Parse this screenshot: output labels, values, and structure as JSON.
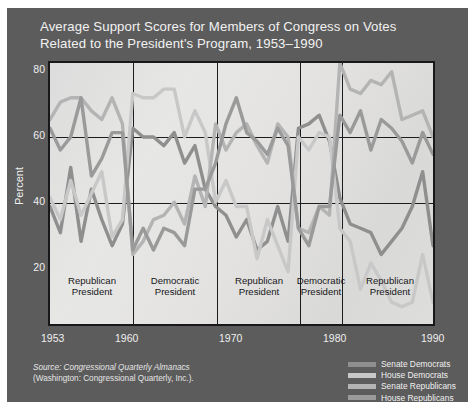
{
  "figure": {
    "background_color": "#5c5c5c",
    "plot_background_color": "#e2e2e0",
    "frame_color": "#18181a"
  },
  "title": {
    "line1": "Average Support Scores for Members of Congress on Votes",
    "line2": "Related to the President's Program, 1953–1990"
  },
  "axes": {
    "ylabel": "Percent",
    "yticks": [
      "80",
      "60",
      "40",
      "20"
    ],
    "xticks": [
      "1953",
      "1960",
      "1970",
      "1980",
      "1990"
    ]
  },
  "periods": [
    {
      "line1": "Republican",
      "line2": "President"
    },
    {
      "line1": "Democratic",
      "line2": "President"
    },
    {
      "line1": "Republican",
      "line2": "President"
    },
    {
      "line1": "Democratic",
      "line2": "President"
    },
    {
      "line1": "Republican",
      "line2": "President"
    }
  ],
  "legend": {
    "items": [
      {
        "label": "Senate Democrats",
        "color": "#8f8f8f"
      },
      {
        "label": "House Democrats",
        "color": "#c8c8c8"
      },
      {
        "label": "Senate Republicans",
        "color": "#b4b4b4"
      },
      {
        "label": "House Republicans",
        "color": "#9a9a9a"
      }
    ]
  },
  "source": {
    "line1_italic": "Source: Congressional Quarterly Almanacs",
    "line2": "(Washington: Congressional Quarterly, Inc.)."
  },
  "chart_data": {
    "type": "line",
    "title": "Average Support Scores for Members of Congress on Votes Related to the President's Program, 1953–1990",
    "xlabel": "",
    "ylabel": "Percent",
    "xlim": [
      1953,
      1990
    ],
    "ylim": [
      20,
      80
    ],
    "yticks": [
      20,
      40,
      60,
      80
    ],
    "xticks": [
      1953,
      1960,
      1970,
      1980,
      1990
    ],
    "grid": true,
    "legend_position": "bottom-right",
    "x": [
      1953,
      1954,
      1955,
      1956,
      1957,
      1958,
      1959,
      1960,
      1961,
      1962,
      1963,
      1964,
      1965,
      1966,
      1967,
      1968,
      1969,
      1970,
      1971,
      1972,
      1973,
      1974,
      1975,
      1976,
      1977,
      1978,
      1979,
      1980,
      1981,
      1982,
      1983,
      1984,
      1985,
      1986,
      1987,
      1988,
      1989,
      1990
    ],
    "series": [
      {
        "name": "Senate Democrats",
        "color": "#8f8f8f",
        "values": [
          47,
          41,
          56,
          39,
          51,
          44,
          38,
          43,
          65,
          63,
          63,
          61,
          64,
          57,
          61,
          51,
          47,
          45,
          40,
          44,
          37,
          39,
          47,
          39,
          65,
          66,
          68,
          62,
          49,
          43,
          42,
          41,
          36,
          39,
          42,
          47,
          55,
          38
        ]
      },
      {
        "name": "House Democrats",
        "color": "#c8c8c8",
        "values": [
          49,
          44,
          53,
          45,
          50,
          55,
          40,
          44,
          73,
          72,
          72,
          74,
          74,
          63,
          69,
          64,
          48,
          53,
          47,
          47,
          35,
          44,
          38,
          32,
          63,
          60,
          64,
          63,
          42,
          39,
          28,
          34,
          30,
          25,
          24,
          25,
          36,
          25
        ]
      },
      {
        "name": "Senate Republicans",
        "color": "#b4b4b4",
        "values": [
          67,
          71,
          72,
          72,
          69,
          67,
          72,
          66,
          36,
          39,
          44,
          45,
          48,
          43,
          54,
          47,
          66,
          60,
          64,
          66,
          61,
          57,
          66,
          63,
          42,
          41,
          47,
          45,
          80,
          74,
          73,
          76,
          75,
          78,
          67,
          68,
          69,
          63
        ]
      },
      {
        "name": "House Republicans",
        "color": "#9a9a9a",
        "values": [
          65,
          60,
          63,
          72,
          54,
          58,
          64,
          64,
          37,
          42,
          37,
          42,
          41,
          38,
          51,
          51,
          57,
          66,
          72,
          64,
          62,
          59,
          65,
          61,
          42,
          38,
          47,
          47,
          68,
          64,
          69,
          60,
          67,
          65,
          62,
          57,
          64,
          59
        ]
      }
    ],
    "period_bands": [
      {
        "label": "Republican President",
        "start": 1953,
        "end": 1961
      },
      {
        "label": "Democratic President",
        "start": 1961,
        "end": 1969
      },
      {
        "label": "Republican President",
        "start": 1969,
        "end": 1977
      },
      {
        "label": "Democratic President",
        "start": 1977,
        "end": 1981
      },
      {
        "label": "Republican President",
        "start": 1981,
        "end": 1990
      }
    ]
  }
}
